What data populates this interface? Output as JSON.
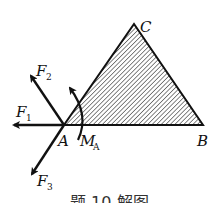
{
  "diagram": {
    "type": "free-body diagram",
    "body": {
      "shape": "triangle",
      "fill": "hatched",
      "vertices": {
        "A": {
          "label": "A",
          "x": 64,
          "y": 125
        },
        "B": {
          "label": "B",
          "x": 203,
          "y": 125
        },
        "C": {
          "label": "C",
          "x": 134,
          "y": 24
        }
      }
    },
    "forces": [
      {
        "id": "F1",
        "label": "F",
        "sub": "1",
        "direction": "left"
      },
      {
        "id": "F2",
        "label": "F",
        "sub": "2",
        "direction": "up-left"
      },
      {
        "id": "F3",
        "label": "F",
        "sub": "3",
        "direction": "down-left"
      }
    ],
    "moment": {
      "label": "M",
      "sub": "A",
      "direction": "counterclockwise",
      "at": "A"
    },
    "caption": "题 10 解图"
  },
  "colors": {
    "stroke": "#111111",
    "hatch": "#222222",
    "background": "#ffffff"
  }
}
